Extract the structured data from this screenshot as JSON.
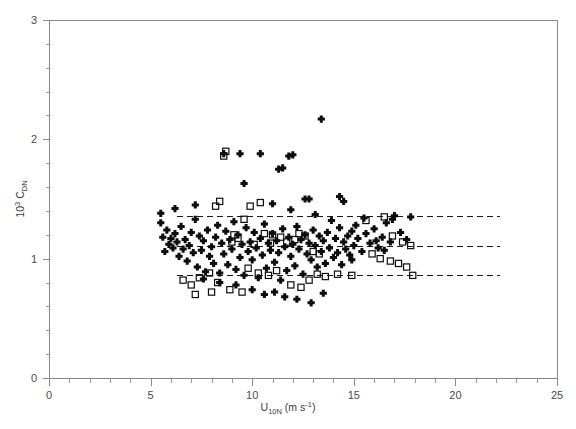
{
  "chart_data": {
    "type": "scatter",
    "title": "",
    "xlabel": "U10N (m s-1)",
    "ylabel": "10^3 CDN",
    "xlabel_parts": {
      "base": "U",
      "sub": "10N",
      "units": " (m s",
      "sup": "-1",
      "units_close": ")"
    },
    "ylabel_parts": {
      "base": "10",
      "sup": "3",
      "symbol": " C",
      "sub": "DN"
    },
    "xlim": [
      0,
      25
    ],
    "ylim": [
      0,
      3
    ],
    "xticks": [
      0,
      5,
      10,
      15,
      20,
      25
    ],
    "xtick_labels": [
      "0",
      "5",
      "10",
      "15",
      "20",
      "25"
    ],
    "xminor_step": 1,
    "yticks": [
      0,
      1,
      2,
      3
    ],
    "ytick_labels": [
      "0",
      "1",
      "2",
      "3"
    ],
    "yminor_step": 0.2,
    "grid": false,
    "legend": false,
    "legend_position": "none",
    "reference_lines": [
      {
        "name": "upper-bound",
        "y": 1.36,
        "style": "dashed",
        "x_start": 6.3,
        "x_end": 22.2
      },
      {
        "name": "mean",
        "y": 1.11,
        "style": "dashed",
        "x_start": 6.3,
        "x_end": 22.2
      },
      {
        "name": "lower-bound",
        "y": 0.865,
        "style": "dashed",
        "x_start": 6.3,
        "x_end": 22.2
      }
    ],
    "series": [
      {
        "name": "filled-plus",
        "marker": "plus",
        "color": "#0d0d0d",
        "points": [
          [
            5.5,
            1.3
          ],
          [
            5.6,
            1.18
          ],
          [
            5.7,
            1.06
          ],
          [
            5.8,
            1.24
          ],
          [
            5.9,
            1.12
          ],
          [
            6.0,
            1.17
          ],
          [
            6.1,
            1.09
          ],
          [
            6.2,
            1.21
          ],
          [
            6.3,
            1.14
          ],
          [
            6.4,
            1.02
          ],
          [
            6.5,
            1.27
          ],
          [
            6.6,
            1.08
          ],
          [
            6.7,
            1.16
          ],
          [
            6.8,
            0.98
          ],
          [
            6.9,
            1.11
          ],
          [
            7.0,
            1.22
          ],
          [
            7.1,
            1.05
          ],
          [
            7.2,
            1.33
          ],
          [
            7.3,
            0.93
          ],
          [
            7.4,
            1.19
          ],
          [
            7.5,
            1.07
          ],
          [
            7.6,
            1.15
          ],
          [
            7.7,
            0.89
          ],
          [
            7.8,
            1.24
          ],
          [
            7.9,
            1.02
          ],
          [
            8.0,
            1.1
          ],
          [
            8.1,
            0.96
          ],
          [
            8.2,
            1.18
          ],
          [
            8.3,
            1.28
          ],
          [
            8.4,
            0.88
          ],
          [
            8.5,
            1.13
          ],
          [
            8.6,
            1.04
          ],
          [
            8.7,
            1.23
          ],
          [
            8.8,
            0.95
          ],
          [
            8.9,
            1.16
          ],
          [
            9.0,
            1.08
          ],
          [
            9.1,
            1.31
          ],
          [
            9.2,
            0.91
          ],
          [
            9.3,
            1.2
          ],
          [
            9.4,
            1.01
          ],
          [
            9.5,
            1.12
          ],
          [
            9.6,
            0.86
          ],
          [
            9.7,
            1.26
          ],
          [
            9.8,
            1.06
          ],
          [
            9.9,
            1.14
          ],
          [
            10.0,
            0.99
          ],
          [
            10.1,
            1.22
          ],
          [
            10.2,
            1.09
          ],
          [
            10.3,
            0.84
          ],
          [
            10.4,
            1.17
          ],
          [
            10.5,
            1.03
          ],
          [
            10.6,
            1.29
          ],
          [
            10.7,
            0.92
          ],
          [
            10.8,
            1.13
          ],
          [
            10.9,
            1.07
          ],
          [
            11.0,
            1.21
          ],
          [
            11.1,
            0.97
          ],
          [
            11.2,
            1.15
          ],
          [
            11.3,
            1.05
          ],
          [
            11.4,
            0.82
          ],
          [
            11.5,
            1.25
          ],
          [
            11.6,
            1.1
          ],
          [
            11.7,
            0.9
          ],
          [
            11.8,
            1.18
          ],
          [
            11.9,
            1.02
          ],
          [
            12.0,
            1.12
          ],
          [
            12.1,
            0.94
          ],
          [
            12.2,
            1.27
          ],
          [
            12.3,
            1.08
          ],
          [
            12.4,
            1.16
          ],
          [
            12.5,
            0.87
          ],
          [
            12.6,
            1.2
          ],
          [
            12.7,
            1.04
          ],
          [
            12.8,
            1.13
          ],
          [
            12.9,
            0.99
          ],
          [
            13.0,
            1.24
          ],
          [
            13.1,
            1.11
          ],
          [
            13.2,
            0.93
          ],
          [
            13.3,
            1.19
          ],
          [
            13.4,
            1.06
          ],
          [
            13.5,
            1.15
          ],
          [
            13.6,
            0.96
          ],
          [
            13.7,
            1.22
          ],
          [
            13.8,
            1.09
          ],
          [
            13.9,
            1.32
          ],
          [
            14.0,
            1.01
          ],
          [
            14.1,
            1.17
          ],
          [
            14.2,
            1.05
          ],
          [
            14.3,
            1.26
          ],
          [
            14.4,
            0.95
          ],
          [
            14.5,
            1.14
          ],
          [
            14.6,
            1.08
          ],
          [
            14.7,
            1.19
          ],
          [
            14.8,
            1.03
          ],
          [
            14.9,
            1.23
          ],
          [
            15.0,
            1.11
          ],
          [
            15.2,
            1.17
          ],
          [
            15.4,
            1.06
          ],
          [
            15.6,
            1.21
          ],
          [
            15.8,
            1.13
          ],
          [
            16.0,
            1.25
          ],
          [
            16.2,
            1.09
          ],
          [
            16.4,
            1.18
          ],
          [
            16.6,
            1.3
          ],
          [
            16.8,
            1.14
          ],
          [
            17.0,
            1.36
          ],
          [
            17.3,
            1.22
          ],
          [
            17.6,
            1.16
          ],
          [
            5.5,
            1.38
          ],
          [
            6.2,
            1.42
          ],
          [
            7.2,
            1.45
          ],
          [
            8.6,
            1.88
          ],
          [
            9.4,
            1.88
          ],
          [
            10.4,
            1.88
          ],
          [
            11.3,
            1.75
          ],
          [
            11.5,
            1.76
          ],
          [
            11.8,
            1.86
          ],
          [
            12.0,
            1.87
          ],
          [
            13.4,
            2.17
          ],
          [
            9.6,
            1.63
          ],
          [
            11.0,
            1.46
          ],
          [
            12.6,
            1.5
          ],
          [
            12.8,
            1.5
          ],
          [
            11.9,
            1.41
          ],
          [
            13.1,
            1.37
          ],
          [
            14.3,
            1.52
          ],
          [
            14.5,
            1.48
          ],
          [
            10.0,
            0.74
          ],
          [
            10.6,
            0.7
          ],
          [
            11.1,
            0.72
          ],
          [
            11.6,
            0.68
          ],
          [
            12.2,
            0.66
          ],
          [
            12.9,
            0.63
          ],
          [
            13.5,
            0.71
          ],
          [
            9.2,
            0.78
          ],
          [
            8.4,
            0.8
          ],
          [
            7.6,
            0.83
          ],
          [
            16.9,
            1.33
          ],
          [
            17.8,
            1.35
          ],
          [
            15.1,
            1.28
          ],
          [
            15.5,
            1.34
          ],
          [
            16.1,
            1.15
          ],
          [
            16.5,
            1.07
          ],
          [
            14.9,
            0.99
          ]
        ]
      },
      {
        "name": "open-square",
        "marker": "square",
        "color": "#0d0d0d",
        "points": [
          [
            6.6,
            0.82
          ],
          [
            7.0,
            0.78
          ],
          [
            7.4,
            0.84
          ],
          [
            7.9,
            0.88
          ],
          [
            8.3,
            0.8
          ],
          [
            8.6,
            1.86
          ],
          [
            8.7,
            1.9
          ],
          [
            8.2,
            1.44
          ],
          [
            8.4,
            1.48
          ],
          [
            9.9,
            1.44
          ],
          [
            9.6,
            1.33
          ],
          [
            10.4,
            1.47
          ],
          [
            10.6,
            1.21
          ],
          [
            11.0,
            1.2
          ],
          [
            11.4,
            1.18
          ],
          [
            9.1,
            1.2
          ],
          [
            9.3,
            1.17
          ],
          [
            9.0,
            1.14
          ],
          [
            10.1,
            1.12
          ],
          [
            10.9,
            1.13
          ],
          [
            11.7,
            1.14
          ],
          [
            12.1,
            1.16
          ],
          [
            9.8,
            0.92
          ],
          [
            10.3,
            0.88
          ],
          [
            10.8,
            0.86
          ],
          [
            11.2,
            0.9
          ],
          [
            11.9,
            0.78
          ],
          [
            12.4,
            0.76
          ],
          [
            12.8,
            0.82
          ],
          [
            13.2,
            0.87
          ],
          [
            13.6,
            0.85
          ],
          [
            9.5,
            0.72
          ],
          [
            8.9,
            0.74
          ],
          [
            8.0,
            0.72
          ],
          [
            7.2,
            0.7
          ],
          [
            14.2,
            0.87
          ],
          [
            14.9,
            0.86
          ],
          [
            15.6,
            1.32
          ],
          [
            16.5,
            1.35
          ],
          [
            15.9,
            1.04
          ],
          [
            16.3,
            1.0
          ],
          [
            16.8,
            0.98
          ],
          [
            17.2,
            0.96
          ],
          [
            17.6,
            0.93
          ],
          [
            17.9,
            0.86
          ],
          [
            17.4,
            1.14
          ],
          [
            17.8,
            1.11
          ],
          [
            16.9,
            1.19
          ],
          [
            13.0,
            1.06
          ],
          [
            13.3,
            1.04
          ],
          [
            12.3,
            1.21
          ],
          [
            12.6,
            1.19
          ]
        ]
      }
    ]
  },
  "axes": {
    "x_axis_name": "x-axis",
    "y_axis_name": "y-axis",
    "frame_color": "#888888",
    "marker_color": "#0d0d0d",
    "refline_color": "#1a1a1a"
  }
}
